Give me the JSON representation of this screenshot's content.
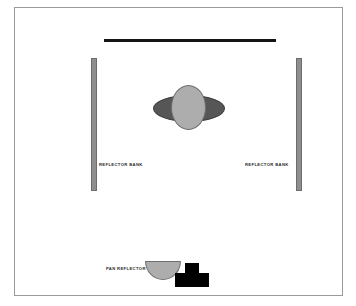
{
  "diagram": {
    "background_color": "#ffffff",
    "frame": {
      "name": "studio-floor-plan-frame",
      "border_color": "#9a9a9a"
    },
    "elements": {
      "top_light_bar": {
        "name": "overhead-light-bar",
        "color": "#141414"
      },
      "reflector_bank_left": {
        "label": "REFLECTOR BANK",
        "color": "#8f8f8f",
        "outline_color": "#6d6d6d"
      },
      "reflector_bank_right": {
        "label": "REFLECTOR BANK",
        "color": "#8f8f8f",
        "outline_color": "#6d6d6d"
      },
      "pan_reflector": {
        "label": "PAN REFLECTOR",
        "color": "#adadad",
        "outline_color": "#6f6f6f"
      },
      "subject_outer": {
        "name": "subject-shoulders-ellipse",
        "color": "#565656",
        "outline_color": "#3f3f3f"
      },
      "subject_inner": {
        "name": "subject-head-ellipse",
        "color": "#adadad",
        "outline_color": "#6f6f6f"
      },
      "camera_block": {
        "name": "camera-on-tripod",
        "color": "#000000"
      }
    }
  }
}
